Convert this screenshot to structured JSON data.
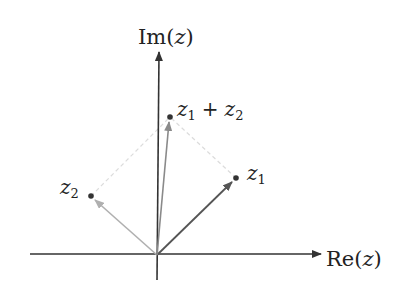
{
  "diagram": {
    "axes": {
      "x_label": "Re(z)",
      "x_label_parts": {
        "fn": "Re",
        "open": "(",
        "var": "z",
        "close": ")"
      },
      "y_label": "Im(z)",
      "y_label_parts": {
        "fn": "Im",
        "open": "(",
        "var": "z",
        "close": ")"
      }
    },
    "points": [
      {
        "id": "z1",
        "label": "z1",
        "base": "z",
        "sub": "1",
        "color": "#555555"
      },
      {
        "id": "z2",
        "label": "z2",
        "base": "z",
        "sub": "2",
        "color": "#aaaaaa"
      },
      {
        "id": "sum",
        "label": "z1 + z2",
        "base1": "z",
        "sub1": "1",
        "op": "+",
        "base2": "z",
        "sub2": "2",
        "color": "#888888"
      }
    ],
    "colors": {
      "axis": "#333333",
      "z1_vector": "#555555",
      "z2_vector": "#b0b0b0",
      "sum_vector": "#8a8a8a",
      "dashed_guides": "#dddddd",
      "dot": "#333333"
    }
  }
}
